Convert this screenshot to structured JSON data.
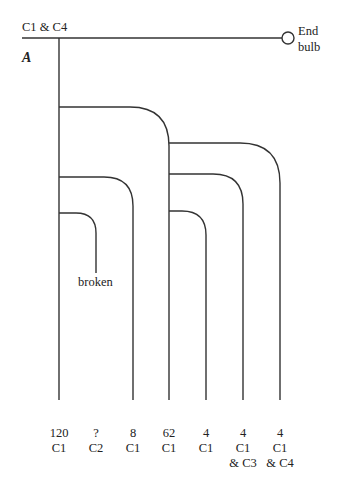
{
  "diagram": {
    "top_label": "C1 & C4",
    "node_label": "A",
    "end_label_line1": "End",
    "end_label_line2": "bulb",
    "broken_label": "broken",
    "branches": [
      {
        "value": "120",
        "line1": "C1",
        "line2": ""
      },
      {
        "value": "?",
        "line1": "C2",
        "line2": ""
      },
      {
        "value": "8",
        "line1": "C1",
        "line2": ""
      },
      {
        "value": "62",
        "line1": "C1",
        "line2": ""
      },
      {
        "value": "4",
        "line1": "C1",
        "line2": ""
      },
      {
        "value": "4",
        "line1": "C1",
        "line2": "& C3"
      },
      {
        "value": "4",
        "line1": "C1",
        "line2": "& C4"
      }
    ]
  }
}
